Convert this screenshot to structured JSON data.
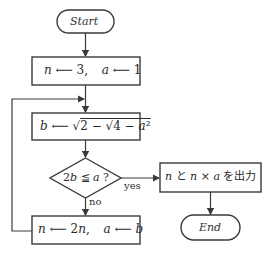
{
  "flowchart": {
    "start": {
      "label": "Start"
    },
    "init": {
      "parts": [
        "n",
        "3,",
        "a",
        "1"
      ]
    },
    "compute": {
      "lhs": "b",
      "expr": "√2 − √4 − a²"
    },
    "decision": {
      "label": "2b ≦ a ?",
      "yes_label": "yes",
      "no_label": "no"
    },
    "output": {
      "label": "n と n × a を出力"
    },
    "update": {
      "parts": [
        "n",
        "2n,",
        "a",
        "b"
      ]
    },
    "end": {
      "label": "End"
    }
  },
  "colors": {
    "line": "#3a3a3a",
    "background": "#ffffff",
    "text": "#2a2a2a"
  }
}
